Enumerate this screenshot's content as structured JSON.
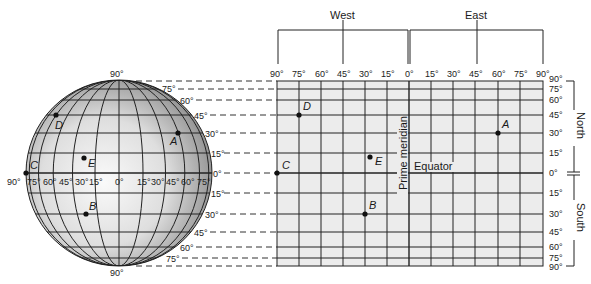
{
  "header": {
    "west_label": "West",
    "east_label": "East"
  },
  "globe": {
    "top_label": "90°",
    "bottom_label": "90°",
    "equator_labels": [
      "90°",
      "75°",
      "60°",
      "45°",
      "30°",
      "15°",
      "0°",
      "15°",
      "30°",
      "45°",
      "60°",
      "75°"
    ],
    "latitude_labels_north": [
      "75°",
      "60°",
      "45°",
      "30°",
      "15°"
    ],
    "equator_side_label": "0°",
    "latitude_labels_south": [
      "15°",
      "30°",
      "45°",
      "60°",
      "75°"
    ]
  },
  "grid": {
    "longitude_labels": [
      "90°",
      "75°",
      "60°",
      "45°",
      "30°",
      "15°",
      "0°",
      "15°",
      "30°",
      "45°",
      "60°",
      "75°",
      "90°"
    ],
    "latitude_labels": [
      "90°",
      "75°",
      "60°",
      "45°",
      "30°",
      "15°",
      "0°",
      "15°",
      "30°",
      "45°",
      "60°",
      "75°",
      "90°"
    ],
    "north_label": "North",
    "south_label": "South",
    "prime_meridian_label": "Prime meridian",
    "equator_label": "Equator"
  },
  "points": [
    {
      "id": "A",
      "lon": 60,
      "lat": 30,
      "hemi": "NE"
    },
    {
      "id": "B",
      "lon": -30,
      "lat": -30,
      "hemi": "SW"
    },
    {
      "id": "C",
      "lon": -90,
      "lat": 0,
      "hemi": "W"
    },
    {
      "id": "D",
      "lon": -75,
      "lat": 45,
      "hemi": "NW"
    },
    {
      "id": "E",
      "lon": -27,
      "lat": 10,
      "hemi": "NW"
    }
  ],
  "colors": {
    "grid_fill": "#ececec",
    "line": "#222222",
    "globe_light": "#f4f4f4",
    "globe_dark": "#8a8a8a"
  }
}
